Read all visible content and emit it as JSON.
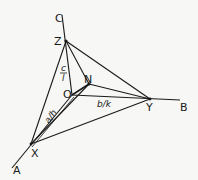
{
  "diagram": {
    "axes": {
      "A": {
        "label": "A"
      },
      "B": {
        "label": "B"
      },
      "C": {
        "label": "C"
      }
    },
    "points": {
      "origin": "O",
      "X": "X",
      "Y": "Y",
      "Z": "Z",
      "N": "N"
    },
    "intercepts": {
      "a_over_h": "a/h",
      "b_over_k": "b/k",
      "c_num": "c",
      "c_den": "l"
    },
    "colors": {
      "ink": "#1a1a1a",
      "paper": "#f7f7f5"
    }
  }
}
